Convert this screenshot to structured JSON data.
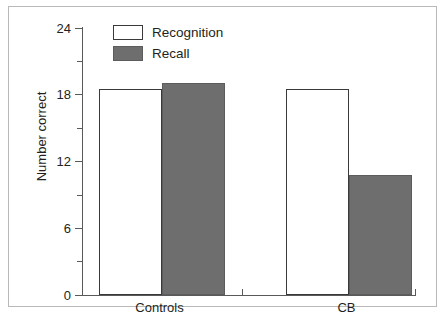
{
  "chart_data": {
    "type": "bar",
    "title": "",
    "xlabel": "",
    "ylabel": "Number correct",
    "categories": [
      "Controls",
      "CB"
    ],
    "series": [
      {
        "name": "Recognition",
        "values": [
          18.5,
          18.5
        ],
        "color": "#ffffff"
      },
      {
        "name": "Recall",
        "values": [
          19.1,
          10.8
        ],
        "color": "#6e6e6e"
      }
    ],
    "ylim": [
      0,
      24
    ],
    "y_major_ticks": [
      0,
      6,
      12,
      18,
      24
    ],
    "y_minor_ticks": [
      3,
      9,
      15,
      21
    ],
    "y_tick_labels": [
      "0",
      "6",
      "12",
      "18",
      "24"
    ],
    "grid": false,
    "legend_position": "top-left-inside"
  },
  "legend": {
    "items": [
      {
        "label": "Recognition",
        "swatch": "white-outlined"
      },
      {
        "label": "Recall",
        "swatch": "gray-filled"
      }
    ]
  },
  "axes": {
    "y_title": "Number correct",
    "y_labels": [
      "24",
      "18",
      "12",
      "6",
      "0"
    ],
    "x_labels": [
      "Controls",
      "CB"
    ]
  },
  "colors": {
    "recall_fill": "#6e6e6e",
    "recognition_fill": "#ffffff",
    "bar_stroke": "#3a3a3a",
    "axis": "#58595b",
    "text": "#231f20",
    "frame": "#b9b9b9"
  }
}
